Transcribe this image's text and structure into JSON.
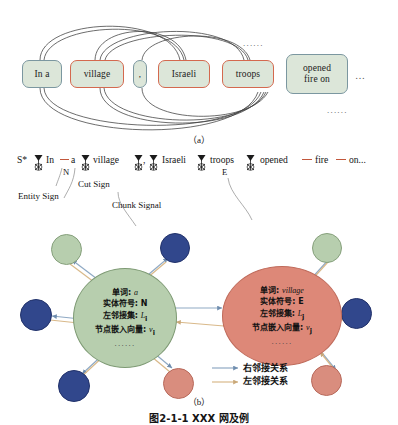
{
  "figure": {
    "caption": "图2-1-1  XXX 网及例",
    "panel_a_label": "（a）",
    "panel_b_label": "（b）"
  },
  "panel_a": {
    "tokens": [
      {
        "text": "In a",
        "type": "chunk"
      },
      {
        "text": "village",
        "type": "entity"
      },
      {
        "text": ",",
        "type": "chunk"
      },
      {
        "text": "Israeli",
        "type": "entity"
      },
      {
        "text": "troops",
        "type": "entity"
      },
      {
        "text": "opened\nfire on",
        "type": "chunk"
      }
    ],
    "trailing_ellipsis": "…",
    "top_ellipsis": "......",
    "bottom_ellipsis": "......"
  },
  "sequence": {
    "start_symbol": "S*",
    "items": [
      "In",
      "a",
      "village",
      ",",
      "Israeli",
      "troops",
      "opened",
      "fire",
      "on..."
    ],
    "entity_marks": [
      {
        "label": "N",
        "after": "a"
      },
      {
        "label": "E",
        "after": "troops"
      }
    ],
    "callouts": [
      {
        "text": "Entity Sign"
      },
      {
        "text": "Cut Sign"
      },
      {
        "text": "Chunk Signal"
      }
    ]
  },
  "graph": {
    "hub_left": {
      "lines": [
        {
          "label": "单词:",
          "value": "a"
        },
        {
          "label": "实体符号:",
          "value": "N"
        },
        {
          "label": "左邻接集:",
          "value": "L",
          "sub": "i"
        },
        {
          "label": "节点嵌入向量:",
          "value": "v",
          "sub": "i"
        }
      ],
      "ellipsis": "......"
    },
    "hub_right": {
      "lines": [
        {
          "label": "单词:",
          "value": "village"
        },
        {
          "label": "实体符号:",
          "value": "E"
        },
        {
          "label": "左邻接集:",
          "value": "L",
          "sub": "j"
        },
        {
          "label": "节点嵌入向量:",
          "value": "v",
          "sub": "j"
        }
      ],
      "ellipsis": "......"
    },
    "legend": [
      {
        "text": "右邻接关系",
        "color": "#8fa9c4"
      },
      {
        "text": "左邻接关系",
        "color": "#d9b98a"
      }
    ]
  },
  "colors": {
    "chunk_border": "#7b97a0",
    "entity_border": "#d4694f",
    "box_fill": "#dce6d9",
    "node_green": "#b7ceae",
    "node_blue": "#31478c",
    "node_red": "#d98d7e",
    "hub_red": "#dd8878",
    "edge_right": "#8fa9c4",
    "edge_left": "#d9b98a",
    "dash_red": "#c2573c"
  }
}
